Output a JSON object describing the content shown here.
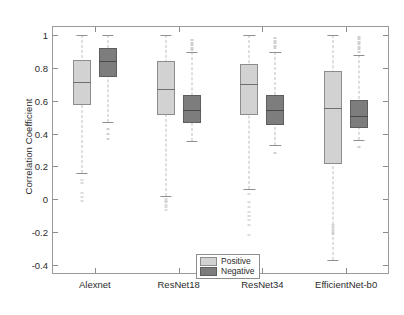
{
  "chart_data": {
    "type": "box",
    "title": "",
    "xlabel": "",
    "ylabel": "Correlation Coefficient",
    "ylim": [
      -0.45,
      1.05
    ],
    "yticks": [
      1,
      0.8,
      0.6,
      0.4,
      0.2,
      0,
      -0.2,
      -0.4
    ],
    "ytick_labels": [
      "1",
      "0.8",
      "0.6",
      "0.4",
      "0.2",
      "0",
      "-0.2",
      "-0.4"
    ],
    "categories": [
      "Alexnet",
      "ResNet18",
      "ResNet34",
      "EfficientNet-b0"
    ],
    "grid": false,
    "legend_position": "lower center",
    "series": [
      {
        "name": "Positive",
        "color": "#d2d2d2",
        "boxes": [
          {
            "category": "Alexnet",
            "whisker_low": 0.16,
            "q1": 0.575,
            "median": 0.715,
            "q3": 0.85,
            "whisker_high": 1.0,
            "outliers": [
              0.12,
              0.1,
              0.04,
              0.015,
              -0.01
            ]
          },
          {
            "category": "ResNet18",
            "whisker_low": 0.02,
            "q1": 0.515,
            "median": 0.675,
            "q3": 0.84,
            "whisker_high": 1.0,
            "outliers": [
              0.0,
              -0.01,
              -0.02,
              -0.035,
              -0.05,
              -0.065
            ]
          },
          {
            "category": "ResNet34",
            "whisker_low": 0.06,
            "q1": 0.515,
            "median": 0.705,
            "q3": 0.825,
            "whisker_high": 1.0,
            "outliers": [
              0.03,
              -0.02,
              -0.05,
              -0.075,
              -0.1,
              -0.125,
              -0.16,
              -0.22
            ]
          },
          {
            "category": "EfficientNet-b0",
            "whisker_low": -0.37,
            "q1": 0.215,
            "median": 0.555,
            "q3": 0.78,
            "whisker_high": 1.0,
            "outliers": [
              -0.155,
              -0.17,
              -0.185,
              -0.2,
              -0.215
            ]
          }
        ]
      },
      {
        "name": "Negative",
        "color": "#7d7d7d",
        "boxes": [
          {
            "category": "Alexnet",
            "whisker_low": 0.47,
            "q1": 0.745,
            "median": 0.84,
            "q3": 0.925,
            "whisker_high": 1.0,
            "outliers": [
              0.43,
              0.4,
              0.37
            ]
          },
          {
            "category": "ResNet18",
            "whisker_low": 0.355,
            "q1": 0.465,
            "median": 0.545,
            "q3": 0.635,
            "whisker_high": 0.9,
            "outliers": [
              0.97,
              0.955,
              0.94,
              0.925,
              0.91
            ]
          },
          {
            "category": "ResNet34",
            "whisker_low": 0.33,
            "q1": 0.455,
            "median": 0.545,
            "q3": 0.635,
            "whisker_high": 0.9,
            "outliers": [
              0.98,
              0.965,
              0.95,
              0.935,
              0.92,
              0.28
            ]
          },
          {
            "category": "EfficientNet-b0",
            "whisker_low": 0.36,
            "q1": 0.435,
            "median": 0.505,
            "q3": 0.605,
            "whisker_high": 0.88,
            "outliers": [
              0.99,
              0.975,
              0.96,
              0.945,
              0.93,
              0.915,
              0.9,
              0.32
            ]
          }
        ]
      }
    ]
  },
  "legend": {
    "items": [
      {
        "label": "Positive",
        "swatch": "pos"
      },
      {
        "label": "Negative",
        "swatch": "neg"
      }
    ]
  }
}
